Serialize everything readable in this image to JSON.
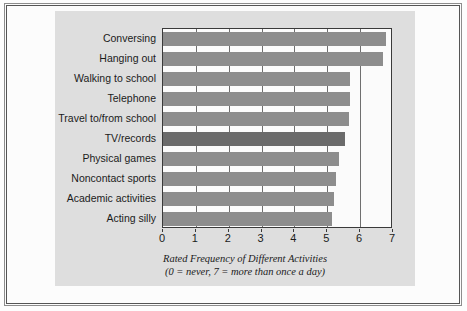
{
  "chart_data": {
    "type": "bar",
    "orientation": "horizontal",
    "title": "",
    "xlabel": "Rated Frequency of Different Activities",
    "ylabel": "",
    "xlim": [
      0,
      7
    ],
    "xticks": [
      0,
      1,
      2,
      3,
      4,
      5,
      6,
      7
    ],
    "grid": true,
    "legend": "none",
    "categories": [
      "Conversing",
      "Hanging out",
      "Walking to school",
      "Telephone",
      "Travel to/from school",
      "TV/records",
      "Physical games",
      "Noncontact sports",
      "Academic activities",
      "Acting silly"
    ],
    "values": [
      6.8,
      6.7,
      5.7,
      5.7,
      5.65,
      5.55,
      5.35,
      5.25,
      5.2,
      5.15
    ],
    "highlight_index": 5,
    "bar_color": "#8d8d8d",
    "highlight_color": "#6b6b6b"
  },
  "caption": {
    "line1": "Rated Frequency of  Different Activities",
    "line2": "(0 = never,  7 = more than once a day)"
  },
  "colors": {
    "panel": "#dedede",
    "frame": "#3a3a3a",
    "grid": "#6f6f6f",
    "text": "#1b1b1b"
  }
}
